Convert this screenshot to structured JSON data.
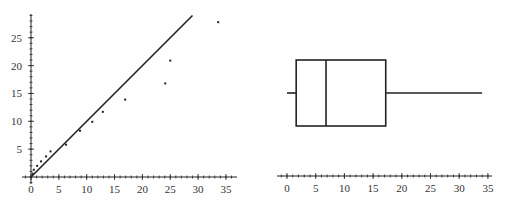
{
  "chart_data": [
    {
      "type": "scatter",
      "title": "",
      "xlabel": "",
      "ylabel": "",
      "xlim": [
        0,
        36
      ],
      "ylim": [
        0,
        29
      ],
      "xticks": [
        0,
        5,
        10,
        15,
        20,
        25,
        30,
        35
      ],
      "yticks": [
        5,
        10,
        15,
        20,
        25
      ],
      "minor_tick_step": 1,
      "grid": false,
      "points": [
        {
          "x": 0.3,
          "y": 0.6
        },
        {
          "x": 0.5,
          "y": 1.3
        },
        {
          "x": 1.1,
          "y": 2.0
        },
        {
          "x": 1.8,
          "y": 2.8
        },
        {
          "x": 2.7,
          "y": 3.7
        },
        {
          "x": 3.5,
          "y": 4.6
        },
        {
          "x": 6.3,
          "y": 5.8
        },
        {
          "x": 8.8,
          "y": 8.3
        },
        {
          "x": 11.0,
          "y": 9.9
        },
        {
          "x": 12.9,
          "y": 11.7
        },
        {
          "x": 16.9,
          "y": 13.9
        },
        {
          "x": 24.1,
          "y": 16.8
        },
        {
          "x": 25.0,
          "y": 20.9
        },
        {
          "x": 33.6,
          "y": 27.8
        }
      ],
      "reference_line": {
        "label": "y = x",
        "from": [
          0,
          0
        ],
        "to": [
          29,
          29
        ]
      }
    },
    {
      "type": "boxplot",
      "title": "",
      "xlabel": "",
      "xlim": [
        0,
        36
      ],
      "xticks": [
        0,
        5,
        10,
        15,
        20,
        25,
        30,
        35
      ],
      "minor_tick_step": 1,
      "grid": false,
      "orientation": "horizontal",
      "stats": {
        "min": 0.0,
        "q1": 1.6,
        "median": 6.8,
        "q3": 17.2,
        "max": 34.0
      }
    }
  ]
}
